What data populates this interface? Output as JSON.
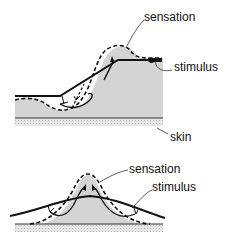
{
  "diagram": {
    "top_panel": {
      "labels": {
        "sensation": "sensation",
        "stimulus": "stimulus",
        "skin": "skin"
      }
    },
    "bottom_panel": {
      "labels": {
        "sensation": "sensation",
        "stimulus": "stimulus"
      }
    },
    "colors": {
      "fill": "#d4d4d4",
      "line": "#111111",
      "skin_band": "#cfcfcf",
      "background": "#ffffff"
    }
  }
}
